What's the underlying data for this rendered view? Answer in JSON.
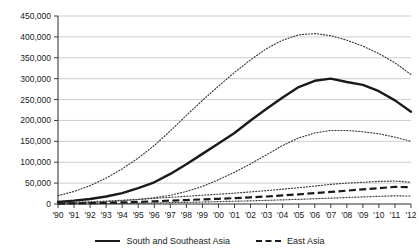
{
  "chart_data": {
    "type": "line",
    "title": "",
    "xlabel": "",
    "ylabel": "",
    "grid": true,
    "legend_position": "bottom-center",
    "ylim": [
      0,
      450000
    ],
    "ytick_values": [
      0,
      50000,
      100000,
      150000,
      200000,
      250000,
      300000,
      350000,
      400000,
      450000
    ],
    "ytick_labels": [
      "0",
      "50,000",
      "100,000",
      "150,000",
      "200,000",
      "250,000",
      "300,000",
      "350,000",
      "400,000",
      "450,000"
    ],
    "categories": [
      "'90",
      "'91",
      "'92",
      "'93",
      "'94",
      "'95",
      "'96",
      "'97",
      "'98",
      "'99",
      "'00",
      "'01",
      "'02",
      "'03",
      "'04",
      "'05",
      "'06",
      "'07",
      "'08",
      "'09",
      "'10",
      "'11",
      "'12"
    ],
    "x": [
      1990,
      1991,
      1992,
      1993,
      1994,
      1995,
      1996,
      1997,
      1998,
      1999,
      2000,
      2001,
      2002,
      2003,
      2004,
      2005,
      2006,
      2007,
      2008,
      2009,
      2010,
      2011,
      2012
    ],
    "series": [
      {
        "name": "South and Southeast Asia",
        "style": "solid",
        "values": [
          5000,
          8000,
          12000,
          18000,
          26000,
          38000,
          52000,
          72000,
          95000,
          120000,
          145000,
          170000,
          200000,
          228000,
          255000,
          280000,
          295000,
          300000,
          292000,
          285000,
          270000,
          248000,
          221000
        ]
      },
      {
        "name": "South and Southeast Asia upper bound",
        "style": "dotted",
        "values": [
          20000,
          30000,
          44000,
          62000,
          84000,
          110000,
          140000,
          175000,
          212000,
          248000,
          282000,
          315000,
          345000,
          372000,
          392000,
          405000,
          408000,
          403000,
          392000,
          378000,
          360000,
          338000,
          310000
        ]
      },
      {
        "name": "South and Southeast Asia lower bound",
        "style": "dotted",
        "values": [
          1000,
          2000,
          3500,
          5500,
          8000,
          11000,
          15000,
          21000,
          30000,
          42000,
          58000,
          76000,
          96000,
          118000,
          140000,
          158000,
          170000,
          176000,
          176000,
          173000,
          168000,
          160000,
          150000
        ]
      },
      {
        "name": "East Asia",
        "style": "dashed",
        "values": [
          1000,
          1500,
          2000,
          2800,
          3800,
          5000,
          6500,
          8000,
          9500,
          11000,
          12500,
          14000,
          16000,
          18000,
          20500,
          23000,
          26000,
          29000,
          32000,
          35000,
          38000,
          41000,
          40000
        ]
      },
      {
        "name": "East Asia upper bound",
        "style": "dotted",
        "values": [
          3000,
          4000,
          5500,
          7000,
          9000,
          11000,
          13500,
          16000,
          18500,
          21000,
          23500,
          26000,
          29000,
          32000,
          35500,
          39000,
          43000,
          47000,
          50000,
          52000,
          54000,
          55000,
          52000
        ]
      },
      {
        "name": "East Asia lower bound",
        "style": "dotted",
        "values": [
          300,
          500,
          700,
          1000,
          1400,
          1900,
          2500,
          3200,
          4000,
          4800,
          5700,
          6600,
          7600,
          8700,
          9900,
          11200,
          12600,
          14100,
          15600,
          17000,
          18400,
          19600,
          19000
        ]
      }
    ]
  },
  "legend": {
    "items": [
      {
        "label": "South and Southeast Asia",
        "marker": "solid-line"
      },
      {
        "label": "East Asia",
        "marker": "dashed-line"
      }
    ]
  }
}
